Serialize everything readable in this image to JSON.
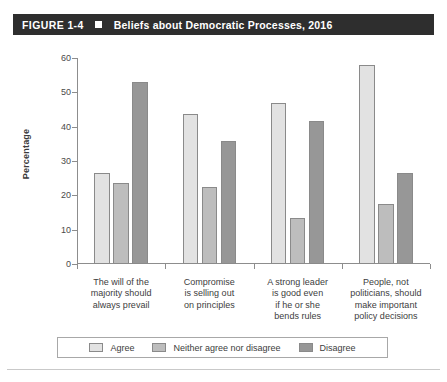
{
  "header": {
    "figure_number": "FIGURE 1-4",
    "marker": "square-bullet",
    "title": "Beliefs about Democratic Processes, 2016"
  },
  "chart_data": {
    "type": "bar",
    "title": "Beliefs about Democratic Processes, 2016",
    "xlabel": "",
    "ylabel": "Percentage",
    "ylim": [
      0,
      60
    ],
    "yticks": [
      0,
      10,
      20,
      30,
      40,
      50,
      60
    ],
    "grid": false,
    "legend_position": "bottom",
    "categories": [
      "The will of the\nmajority should\nalways prevail",
      "Compromise\nis selling out\non principles",
      "A strong leader\nis good even\nif he or she\nbends rules",
      "People, not\npoliticians, should\nmake important\npolicy decisions"
    ],
    "category_lines": [
      [
        "The will of the",
        "majority should",
        "always prevail"
      ],
      [
        "Compromise",
        "is selling out",
        "on principles"
      ],
      [
        "A strong leader",
        "is good even",
        "if he or she",
        "bends rules"
      ],
      [
        "People, not",
        "politicians, should",
        "make important",
        "policy decisions"
      ]
    ],
    "series": [
      {
        "name": "Agree",
        "color": "#e2e2e2",
        "values": [
          26.5,
          43.8,
          47.0,
          58.0
        ]
      },
      {
        "name": "Neither agree nor disagree",
        "color": "#bdbdbd",
        "values": [
          23.5,
          22.4,
          13.3,
          17.5
        ]
      },
      {
        "name": "Disagree",
        "color": "#979797",
        "values": [
          53.0,
          35.8,
          41.8,
          26.5
        ]
      }
    ]
  },
  "colors": {
    "header_bg": "#2e2e2e",
    "header_text": "#ffffff",
    "axis": "#8d8d8d",
    "bar_border": "#8a8a8a",
    "legend_border": "#a8a8a8"
  }
}
